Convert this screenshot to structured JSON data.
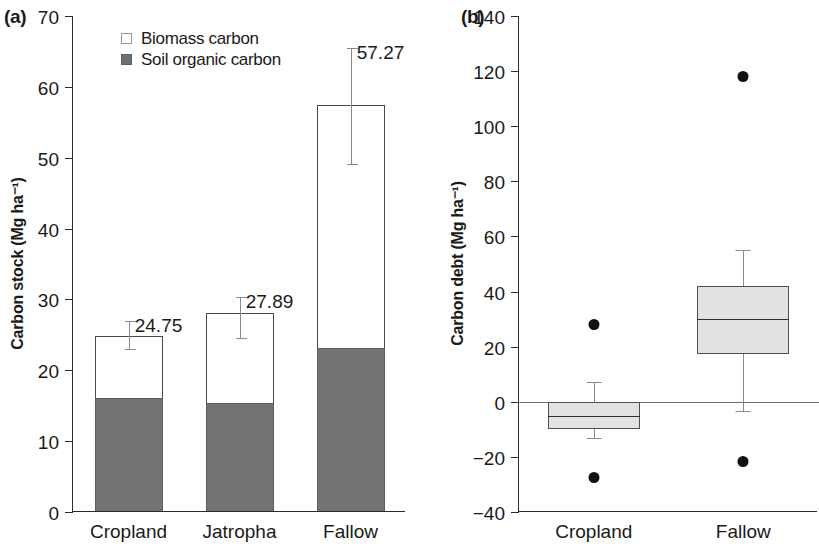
{
  "figure": {
    "panels": [
      {
        "tag": "(a)"
      },
      {
        "tag": "(b)"
      }
    ]
  },
  "chart_data": [
    {
      "type": "bar",
      "panel_tag": "(a)",
      "title": "",
      "xlabel": "",
      "ylabel": "Carbon stock (Mg ha⁻¹)",
      "ylim": [
        0,
        70
      ],
      "yticks": [
        0,
        10,
        20,
        30,
        40,
        50,
        60,
        70
      ],
      "ytick_labels": [
        "0",
        "10",
        "20",
        "30",
        "40",
        "50",
        "60",
        "70"
      ],
      "grid": false,
      "stacked": true,
      "legend_position": "top-left",
      "categories": [
        "Cropland",
        "Jatropha",
        "Fallow"
      ],
      "series": [
        {
          "name": "Soil organic carbon",
          "color": "#737373",
          "values": [
            16.0,
            15.2,
            23.0
          ]
        },
        {
          "name": "Biomass carbon",
          "color": "#ffffff",
          "values": [
            8.75,
            12.69,
            34.27
          ]
        }
      ],
      "totals": [
        24.75,
        27.89,
        57.27
      ],
      "total_labels": [
        "24.75",
        "27.89",
        "57.27"
      ],
      "error_bars": [
        {
          "category": "Cropland",
          "low": 22.9,
          "high": 27.0
        },
        {
          "category": "Jatropha",
          "low": 24.4,
          "high": 30.4
        },
        {
          "category": "Fallow",
          "low": 48.9,
          "high": 65.5
        }
      ]
    },
    {
      "type": "box",
      "panel_tag": "(b)",
      "title": "",
      "xlabel": "",
      "ylabel": "Carbon debt (Mg ha⁻¹)",
      "ylim": [
        -40,
        140
      ],
      "yticks": [
        -40,
        -20,
        0,
        20,
        40,
        60,
        80,
        100,
        120,
        140
      ],
      "ytick_labels": [
        "−40",
        "−20",
        "0",
        "20",
        "40",
        "60",
        "80",
        "100",
        "120",
        "140"
      ],
      "grid": false,
      "zero_reference_line": 0,
      "categories": [
        "Cropland",
        "Fallow"
      ],
      "boxes": [
        {
          "category": "Cropland",
          "whisker_low": -13.0,
          "q1": -10.0,
          "median": -5.0,
          "q3": 0.0,
          "whisker_high": 7.0,
          "outliers": [
            28.0,
            -27.5
          ]
        },
        {
          "category": "Fallow",
          "whisker_low": -3.5,
          "q1": 17.5,
          "median": 30.0,
          "q3": 42.0,
          "whisker_high": 55.0,
          "outliers": [
            118.0,
            -21.5
          ]
        }
      ]
    }
  ]
}
